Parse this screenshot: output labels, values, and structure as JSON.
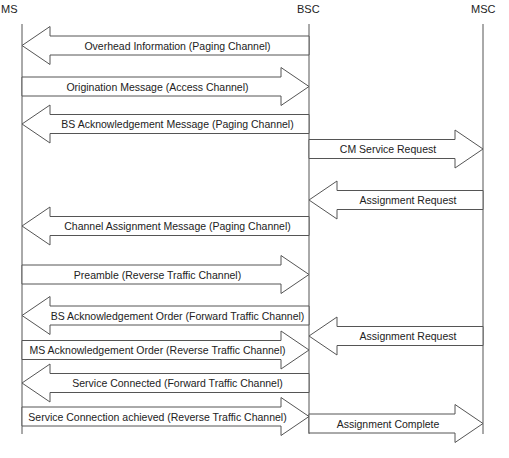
{
  "colors": {
    "line": "#555555",
    "fill": "#ffffff",
    "text": "#222222"
  },
  "entities": [
    {
      "id": "ms",
      "label": "MS",
      "x": 22,
      "label_x": 1,
      "label_y": 3
    },
    {
      "id": "bsc",
      "label": "BSC",
      "x": 309,
      "label_x": 297,
      "label_y": 3
    },
    {
      "id": "msc",
      "label": "MSC",
      "x": 483,
      "label_x": 471,
      "label_y": 3
    }
  ],
  "lifeline": {
    "top": 24,
    "bottom": 434
  },
  "messages": [
    {
      "label": "Overhead Information (Paging Channel)",
      "from": "bsc",
      "to": "ms",
      "y": 45.5
    },
    {
      "label": "Origination Message (Access Channel)",
      "from": "ms",
      "to": "bsc",
      "y": 86.5
    },
    {
      "label": "BS Acknowledgement Message (Paging Channel)",
      "from": "bsc",
      "to": "ms",
      "y": 124
    },
    {
      "label": "CM Service Request",
      "from": "bsc",
      "to": "msc",
      "y": 149
    },
    {
      "label": "Assignment Request",
      "from": "msc",
      "to": "bsc",
      "y": 200
    },
    {
      "label": "Channel Assignment Message (Paging Channel)",
      "from": "bsc",
      "to": "ms",
      "y": 226
    },
    {
      "label": "Preamble (Reverse Traffic Channel)",
      "from": "ms",
      "to": "bsc",
      "y": 274.5
    },
    {
      "label": "BS Acknowledgement Order (Forward Traffic Channel)",
      "from": "bsc",
      "to": "ms",
      "y": 315.5
    },
    {
      "label": "Assignment Request",
      "from": "msc",
      "to": "bsc",
      "y": 336
    },
    {
      "label": "MS Acknowledgement Order (Reverse Traffic Channel)",
      "from": "ms",
      "to": "bsc",
      "y": 350
    },
    {
      "label": "Service Connected (Forward Traffic Channel)",
      "from": "bsc",
      "to": "ms",
      "y": 383
    },
    {
      "label": "Service Connection achieved (Reverse Traffic Channel)",
      "from": "ms",
      "to": "bsc",
      "y": 416.5
    },
    {
      "label": "Assignment Complete",
      "from": "bsc",
      "to": "msc",
      "y": 423.5
    }
  ]
}
